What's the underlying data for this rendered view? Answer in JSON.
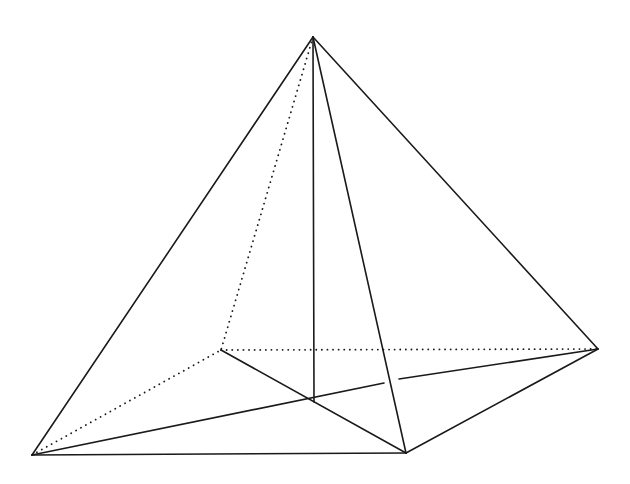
{
  "diagram": {
    "type": "pyramid",
    "colors": {
      "background": "#ffffff",
      "stroke": "#1a1a1a"
    },
    "vertices": {
      "apex": {
        "x": 313,
        "y": 37
      },
      "A": {
        "x": 32,
        "y": 455
      },
      "B": {
        "x": 406,
        "y": 453
      },
      "C": {
        "x": 598,
        "y": 349
      },
      "D": {
        "x": 221,
        "y": 350
      },
      "O": {
        "x": 314,
        "y": 402
      }
    },
    "edges": [
      {
        "id": "apex-A",
        "from": "apex",
        "to": "A",
        "style": "solid"
      },
      {
        "id": "apex-B",
        "from": "apex",
        "to": "B",
        "style": "solid"
      },
      {
        "id": "apex-C",
        "from": "apex",
        "to": "C",
        "style": "solid"
      },
      {
        "id": "apex-O",
        "from": "apex",
        "to": "O",
        "style": "solid"
      },
      {
        "id": "A-B",
        "from": "A",
        "to": "B",
        "style": "solid"
      },
      {
        "id": "B-C",
        "from": "B",
        "to": "C",
        "style": "solid"
      },
      {
        "id": "D-B",
        "from": "D",
        "to": "B",
        "style": "solid"
      },
      {
        "id": "A-C",
        "from": "A",
        "to": "C",
        "style": "solid",
        "gap": {
          "x1": 384,
          "y1": 383,
          "x2": 399,
          "y2": 379
        }
      },
      {
        "id": "apex-D",
        "from": "apex",
        "to": "D",
        "style": "dotted"
      },
      {
        "id": "A-D",
        "from": "A",
        "to": "D",
        "style": "dotted"
      },
      {
        "id": "D-C",
        "from": "D",
        "to": "C",
        "style": "dotted"
      }
    ]
  }
}
